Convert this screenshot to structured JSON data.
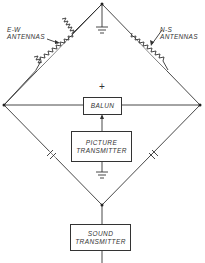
{
  "diagram": {
    "labels": {
      "ew_antennas": [
        "E-W",
        "ANTENNAS"
      ],
      "ns_antennas": [
        "N-S",
        "ANTENNAS"
      ],
      "plus": "+"
    },
    "blocks": {
      "balun": "BALUN",
      "picture_transmitter": [
        "PICTURE",
        "TRANSMITTER"
      ],
      "sound_transmitter": [
        "SOUND",
        "TRANSMITTER"
      ]
    },
    "colors": {
      "line": "#333333",
      "background": "#ffffff"
    }
  }
}
